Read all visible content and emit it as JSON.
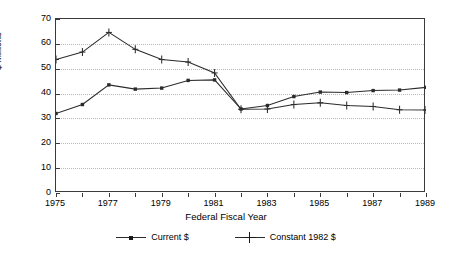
{
  "chart_data": {
    "type": "line",
    "title": "",
    "xlabel": "Federal Fiscal Year",
    "ylabel": "$ Millions",
    "x": [
      1975,
      1976,
      1977,
      1978,
      1979,
      1980,
      1981,
      1982,
      1983,
      1984,
      1985,
      1986,
      1987,
      1988,
      1989
    ],
    "xtick_labels": [
      "1975",
      "",
      "1977",
      "",
      "1979",
      "",
      "1981",
      "",
      "1983",
      "",
      "1985",
      "",
      "1987",
      "",
      "1989"
    ],
    "xlim": [
      1975,
      1989
    ],
    "ylim": [
      0,
      70
    ],
    "yticks": [
      0,
      10,
      20,
      30,
      40,
      50,
      60,
      70
    ],
    "ytick_labels": [
      "0",
      "10",
      "20",
      "30",
      "40",
      "50",
      "60",
      "70"
    ],
    "grid": "horizontal-dotted",
    "legend_position": "bottom-center",
    "series": [
      {
        "name": "Current $",
        "marker": "filled-square",
        "color": "#2b2b2b",
        "values": [
          32.0,
          35.6,
          43.5,
          41.8,
          42.2,
          45.3,
          45.5,
          33.8,
          35.2,
          38.8,
          40.6,
          40.4,
          41.2,
          41.4,
          42.5
        ]
      },
      {
        "name": "Constant 1982 $",
        "marker": "plus",
        "color": "#2b2b2b",
        "values": [
          53.7,
          56.7,
          64.6,
          57.8,
          53.7,
          52.7,
          48.3,
          33.7,
          33.8,
          35.6,
          36.3,
          35.2,
          34.8,
          33.5,
          33.4
        ]
      }
    ]
  },
  "legend": {
    "entries": [
      {
        "label": "Current $",
        "icon": "line-with-square-marker"
      },
      {
        "label": "Constant 1982 $",
        "icon": "line-with-plus-marker"
      }
    ]
  }
}
